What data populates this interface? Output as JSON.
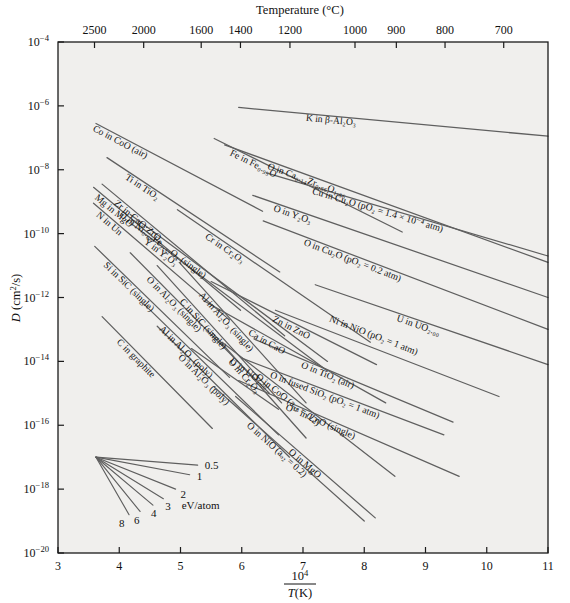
{
  "chart_data": {
    "type": "line",
    "title": "",
    "xlabel": "10^4 / T(K)",
    "ylabel": "D (cm^2/s)",
    "xlim": [
      3,
      11
    ],
    "ylim_exp": [
      -20,
      -4
    ],
    "grid": false,
    "legend_position": "inline-labels",
    "top_axis": {
      "label": "Temperature (°C)",
      "tick_labels": [
        "2500",
        "2000",
        "1600",
        "1400",
        "1200",
        "1000",
        "900",
        "800",
        "700"
      ],
      "tick_x_values": [
        3.596,
        4.399,
        5.338,
        5.979,
        6.787,
        7.849,
        8.524,
        9.319,
        10.277
      ]
    },
    "x_axis": {
      "tick_labels": [
        "3",
        "4",
        "5",
        "6",
        "7",
        "8",
        "9",
        "10",
        "11"
      ],
      "tick_values": [
        3,
        4,
        5,
        6,
        7,
        8,
        9,
        10,
        11
      ]
    },
    "y_axis": {
      "tick_labels": [
        "10⁻⁴",
        "10⁻⁶",
        "10⁻⁸",
        "10⁻¹⁰",
        "10⁻¹²",
        "10⁻¹⁴",
        "10⁻¹⁶",
        "10⁻¹⁸",
        "10⁻²⁰"
      ],
      "tick_exponents": [
        -4,
        -6,
        -8,
        -10,
        -12,
        -14,
        -16,
        -18,
        -20
      ]
    },
    "series": [
      {
        "name": "K in β-Al2O3",
        "label": "K in β-Al₂O₃",
        "x": [
          5.95,
          11.0
        ],
        "logy": [
          -6.05,
          -6.95
        ]
      },
      {
        "name": "Co in CoO (air)",
        "label": "Co in CoO (air)",
        "x": [
          3.62,
          6.34
        ],
        "logy": [
          -6.55,
          -9.3
        ]
      },
      {
        "name": "Fe in Fe0.95O",
        "label": "Fe in Fe₀.₉₅O",
        "x": [
          5.55,
          8.62
        ],
        "logy": [
          -7.02,
          -9.95
        ]
      },
      {
        "name": "O in Ca0.14Zr0.86O1.86",
        "label": "O in Ca₀.₁₄Zr₀.₈₆O₁.₈₆",
        "x": [
          5.72,
          11.0
        ],
        "logy": [
          -7.22,
          -10.9
        ]
      },
      {
        "name": "Ti in TiO2",
        "label": "Ti in TiO₂",
        "x": [
          3.8,
          6.62
        ],
        "logy": [
          -7.62,
          -11.2
        ]
      },
      {
        "name": "Cu in Cu2O (pO2=1.4e-4 atm)",
        "label": "Cu in Cu₂O (pO₂ = 1.4 × 10⁻⁴ atm)",
        "x": [
          6.4,
          11.0
        ],
        "logy": [
          -8.1,
          -10.7
        ]
      },
      {
        "name": "Mg in MgO",
        "label": "Mg in MgO",
        "x": [
          3.58,
          5.98
        ],
        "logy": [
          -8.55,
          -12.4
        ]
      },
      {
        "name": "Zr in CaO·ZrO2",
        "label": "Zr in CaO·ZrO₂",
        "x": [
          3.72,
          6.7
        ],
        "logy": [
          -8.45,
          -13.2
        ]
      },
      {
        "name": "N in Un",
        "label": "N in Un",
        "x": [
          3.58,
          5.8
        ],
        "logy": [
          -9.05,
          -12.7
        ]
      },
      {
        "name": "O in Y2O3",
        "label": "O in Y₂O₃",
        "x": [
          6.18,
          11.0
        ],
        "logy": [
          -8.8,
          -12.0
        ]
      },
      {
        "name": "Cr in Cr2O3",
        "label": "Cr in Cr₂O₃",
        "x": [
          4.95,
          8.1
        ],
        "logy": [
          -9.25,
          -13.4
        ]
      },
      {
        "name": "O in Ni0.68Fe2.32O4 (single)",
        "label": "O in Ni₀.₆₈Fe₂.₃₂O₄ (single)",
        "x": [
          4.18,
          7.4
        ],
        "logy": [
          -9.4,
          -14.0
        ]
      },
      {
        "name": "Y in Y2O3",
        "label": "Y in Y₂O₃",
        "x": [
          4.22,
          7.4
        ],
        "logy": [
          -9.72,
          -14.3
        ]
      },
      {
        "name": "O in Cu2O (pO2=0.2 atm)",
        "label": "O in Cu₂O (pO₂ = 0.2 atm)",
        "x": [
          6.35,
          11.0
        ],
        "logy": [
          -9.6,
          -13.0
        ]
      },
      {
        "name": "Si in SiC (single)",
        "label": "Si in SiC (single)",
        "x": [
          3.6,
          5.8
        ],
        "logy": [
          -10.4,
          -14.5
        ]
      },
      {
        "name": "O in Al2O3 (single)",
        "label": "O in Al₂O₃ (single)",
        "x": [
          4.18,
          6.45
        ],
        "logy": [
          -10.6,
          -15.0
        ]
      },
      {
        "name": "C in SiC (single)",
        "label": "C in SiC (single)",
        "x": [
          4.62,
          6.65
        ],
        "logy": [
          -11.0,
          -15.3
        ]
      },
      {
        "name": "Al in Al2O3 (single)",
        "label": "Al in Al₂O₃ (single)",
        "x": [
          4.98,
          7.05
        ],
        "logy": [
          -10.9,
          -15.3
        ]
      },
      {
        "name": "Zn in ZnO",
        "label": "Zn in ZnO",
        "x": [
          5.5,
          8.2
        ],
        "logy": [
          -11.5,
          -14.1
        ]
      },
      {
        "name": "U in UO2.00",
        "label": "U in UO₂.₀₀",
        "x": [
          7.2,
          11.0
        ],
        "logy": [
          -11.6,
          -14.1
        ]
      },
      {
        "name": "Ca in CaO",
        "label": "Ca in CaO",
        "x": [
          5.38,
          8.35
        ],
        "logy": [
          -12.1,
          -15.3
        ]
      },
      {
        "name": "Ni in NiO (pO2=1 atm)",
        "label": "Ni in NiO (pO₂ = 1 atm)",
        "x": [
          6.55,
          10.2
        ],
        "logy": [
          -12.4,
          -15.1
        ]
      },
      {
        "name": "Al in Al2O3 (poly)",
        "label": "Al in Al₂O₃ (poly)",
        "x": [
          4.4,
          6.6
        ],
        "logy": [
          -12.2,
          -16.3
        ]
      },
      {
        "name": "C in graphite",
        "label": "C in graphite",
        "x": [
          3.72,
          5.52
        ],
        "logy": [
          -12.6,
          -16.1
        ]
      },
      {
        "name": "O in Al2O3 (poly)",
        "label": "O in Al₂O₃ (poly)",
        "x": [
          4.62,
          6.78
        ],
        "logy": [
          -12.9,
          -17.0
        ]
      },
      {
        "name": "O in Cr2O3",
        "label": "O in Cr₂O₃",
        "x": [
          5.52,
          7.05
        ],
        "logy": [
          -13.1,
          -16.4
        ]
      },
      {
        "name": "O in TiO2 (air)",
        "label": "O in TiO₂ (air)",
        "x": [
          6.2,
          9.45
        ],
        "logy": [
          -13.3,
          -15.9
        ]
      },
      {
        "name": "O in CoO (aO2=0.2)",
        "label": "O in CoO (aₒ₂ = 0.2)",
        "x": [
          5.68,
          8.5
        ],
        "logy": [
          -13.4,
          -17.6
        ]
      },
      {
        "name": "U in UO2.00 (low)",
        "label": "U in UO₂.₀₀",
        "x": [
          5.18,
          6.6
        ],
        "logy": [
          -13.6,
          -15.5
        ]
      },
      {
        "name": "O in fused SiO2 (pO2=1 atm)",
        "label": "O in fused SiO₂ (pO₂ = 1 atm)",
        "x": [
          6.0,
          9.3
        ],
        "logy": [
          -13.9,
          -16.3
        ]
      },
      {
        "name": "O18 in ZnO (single)",
        "label": "O¹⁸ in ZnO (single)",
        "x": [
          5.95,
          9.55
        ],
        "logy": [
          -14.6,
          -17.6
        ]
      },
      {
        "name": "O in NiO (aO2=0.2)",
        "label": "O in NiO (aₒ₂ = 0.2)",
        "x": [
          5.55,
          8.0
        ],
        "logy": [
          -14.8,
          -19.0
        ]
      },
      {
        "name": "O in MgO",
        "label": "O in MgO",
        "x": [
          5.9,
          8.18
        ],
        "logy": [
          -15.1,
          -18.9
        ]
      }
    ],
    "activation_fan": {
      "origin": {
        "x": 3.62,
        "logy": -17.0
      },
      "units_label": "eV/atom",
      "entries": [
        {
          "label": "0.5",
          "x_end": 5.28,
          "logy_end": -17.25
        },
        {
          "label": "1",
          "x_end": 5.15,
          "logy_end": -17.55
        },
        {
          "label": "2",
          "x_end": 4.92,
          "logy_end": -18.0
        },
        {
          "label": "3",
          "x_end": 4.72,
          "logy_end": -18.3
        },
        {
          "label": "4",
          "x_end": 4.55,
          "logy_end": -18.5
        },
        {
          "label": "6",
          "x_end": 4.34,
          "logy_end": -18.7
        },
        {
          "label": "8",
          "x_end": 4.16,
          "logy_end": -18.8
        }
      ]
    }
  },
  "colors": {
    "plot_background": "#f0efed",
    "page_background": "#ffffff",
    "line": "#5f5f5f",
    "axis": "#1a1a1a",
    "text": "#111111"
  }
}
